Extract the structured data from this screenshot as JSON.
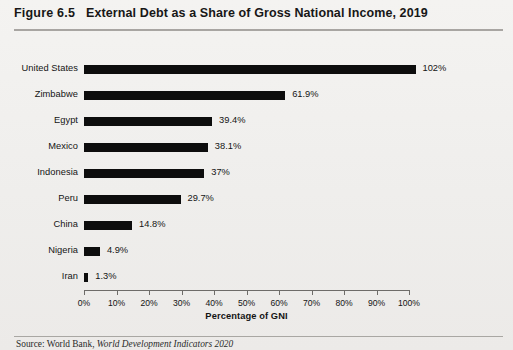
{
  "figure": {
    "number": "Figure 6.5",
    "title": "External Debt as a Share of Gross National Income, 2019",
    "source_prefix": "Source:",
    "source_publisher": "World Bank,",
    "source_work": "World Development Indicators 2020"
  },
  "chart_data": {
    "type": "bar",
    "orientation": "horizontal",
    "title": "External Debt as a Share of Gross National Income, 2019",
    "xlabel": "Percentage of GNI",
    "ylabel": "",
    "xlim": [
      0,
      100
    ],
    "grid": false,
    "legend": null,
    "categories": [
      "United States",
      "Zimbabwe",
      "Egypt",
      "Mexico",
      "Indonesia",
      "Peru",
      "China",
      "Nigeria",
      "Iran"
    ],
    "values": [
      102,
      61.9,
      39.4,
      38.1,
      37,
      29.7,
      14.8,
      4.9,
      1.3
    ],
    "data_labels": [
      "102%",
      "61.9%",
      "39.4%",
      "38.1%",
      "37%",
      "29.7%",
      "14.8%",
      "4.9%",
      "1.3%"
    ],
    "xticks": [
      0,
      10,
      20,
      30,
      40,
      50,
      60,
      70,
      80,
      90,
      100
    ],
    "xtick_labels": [
      "0%",
      "10%",
      "20%",
      "30%",
      "40%",
      "50%",
      "60%",
      "70%",
      "80%",
      "90%",
      "100%"
    ],
    "bar_color": "#0d0d0d",
    "background_color": "#f2f1ef"
  }
}
